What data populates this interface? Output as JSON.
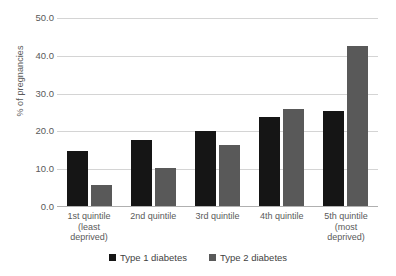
{
  "chart_data": {
    "type": "bar",
    "title": "",
    "xlabel": "",
    "ylabel": "% of pregnancies",
    "ylim": [
      0,
      50
    ],
    "ytick_labels": [
      "50.0",
      "40.0",
      "30.0",
      "20.0",
      "10.0",
      "0.0"
    ],
    "ytick_values": [
      50,
      40,
      30,
      20,
      10,
      0
    ],
    "grid": true,
    "legend_position": "bottom",
    "categories": [
      "1st quintile\n(least\ndeprived)",
      "2nd quintile",
      "3rd quintile",
      "4th quintile",
      "5th quintile\n(most\ndeprived)"
    ],
    "series": [
      {
        "name": "Type 1 diabetes",
        "color": "#151515",
        "values": [
          14.7,
          17.8,
          20.1,
          23.8,
          25.3
        ]
      },
      {
        "name": "Type 2 diabetes",
        "color": "#595959",
        "values": [
          5.9,
          10.2,
          16.5,
          26.0,
          42.7
        ]
      }
    ]
  }
}
